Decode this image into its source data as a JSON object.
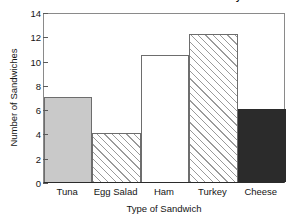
{
  "chart_data": {
    "type": "bar",
    "title": "Number of Sandwiches Sold on Saturday",
    "xlabel": "Type of Sandwich",
    "ylabel": "Number of Sandwiches",
    "categories": [
      "Tuna",
      "Egg Salad",
      "Ham",
      "Turkey",
      "Cheese"
    ],
    "values": [
      7,
      4,
      10.5,
      12.2,
      6
    ],
    "ylim": [
      0,
      14
    ],
    "ytick_labels": [
      "0",
      "2",
      "4",
      "6",
      "8",
      "10",
      "12",
      "14"
    ],
    "ytick_values": [
      0,
      2,
      4,
      6,
      8,
      10,
      12,
      14
    ],
    "grid": false,
    "legend": "none",
    "bar_styles": [
      {
        "category": "Tuna",
        "fill": "solid-light",
        "color": "#c9c9c9"
      },
      {
        "category": "Egg Salad",
        "fill": "hatch",
        "color": "#ffffff"
      },
      {
        "category": "Ham",
        "fill": "none",
        "color": "#ffffff"
      },
      {
        "category": "Turkey",
        "fill": "hatch",
        "color": "#ffffff"
      },
      {
        "category": "Cheese",
        "fill": "solid-dark",
        "color": "#2b2b2b"
      }
    ]
  }
}
